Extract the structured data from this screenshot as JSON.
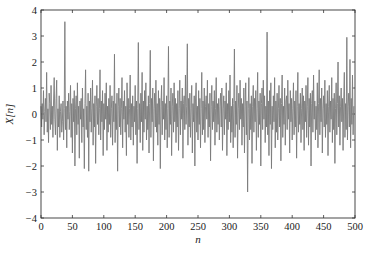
{
  "chart_data": {
    "type": "line",
    "title": "",
    "xlabel": "n",
    "ylabel": "X[n]",
    "xlim": [
      0,
      500
    ],
    "ylim": [
      -4,
      4
    ],
    "xticks": [
      0,
      50,
      100,
      150,
      200,
      250,
      300,
      350,
      400,
      450,
      500
    ],
    "yticks": [
      -4,
      -3,
      -2,
      -1,
      0,
      1,
      2,
      3,
      4
    ],
    "grid": false,
    "legend": null,
    "line_color": "#7a7a7a",
    "series": [
      {
        "name": "X[n]",
        "x_start": 0,
        "x_step": 1,
        "values": [
          0.3,
          -0.5,
          0.4,
          -0.2,
          0.9,
          -0.8,
          0.1,
          0.6,
          -0.3,
          1.6,
          -0.7,
          0.2,
          -1.1,
          0.8,
          0.4,
          -0.6,
          1.1,
          -0.4,
          0.3,
          -0.9,
          0.5,
          1.4,
          -0.2,
          -0.8,
          0.6,
          1.3,
          -1.4,
          0.2,
          -0.5,
          0.7,
          -0.9,
          0.1,
          0.4,
          -0.7,
          -0.3,
          0.5,
          -1.0,
          0.2,
          3.55,
          -0.6,
          0.3,
          -1.3,
          0.5,
          -0.2,
          0.8,
          -0.6,
          0.1,
          1.1,
          -0.9,
          0.4,
          -1.5,
          0.6,
          -0.3,
          0.9,
          -2.0,
          0.2,
          0.7,
          -0.8,
          1.2,
          -0.4,
          0.3,
          -1.7,
          0.5,
          -0.2,
          0.6,
          -1.1,
          1.0,
          -0.5,
          0.2,
          -2.1,
          0.4,
          1.7,
          -0.6,
          0.3,
          -0.9,
          0.8,
          -2.2,
          0.5,
          -0.3,
          1.0,
          -0.7,
          0.2,
          1.3,
          -1.2,
          0.4,
          -0.5,
          0.7,
          -1.9,
          0.3,
          1.1,
          -0.4,
          0.6,
          -0.8,
          0.2,
          1.7,
          -1.0,
          0.5,
          -0.3,
          0.9,
          -1.6,
          0.4,
          -0.6,
          0.8,
          -0.2,
          1.2,
          -1.4,
          0.3,
          -0.7,
          0.6,
          -0.4,
          1.1,
          -0.9,
          0.2,
          0.7,
          -1.2,
          0.5,
          -0.3,
          2.3,
          -1.1,
          0.4,
          -0.6,
          0.8,
          -2.2,
          0.3,
          1.0,
          -0.5,
          0.6,
          -0.8,
          0.2,
          1.4,
          -1.3,
          0.5,
          -0.2,
          0.9,
          -0.7,
          0.3,
          -1.6,
          1.2,
          -0.4,
          0.6,
          -0.9,
          0.2,
          1.5,
          -1.0,
          0.4,
          -0.5,
          0.7,
          -1.2,
          0.3,
          -0.3,
          1.1,
          -0.8,
          0.5,
          -1.9,
          0.2,
          2.75,
          -0.6,
          0.4,
          -1.1,
          0.8,
          -0.3,
          1.6,
          -1.4,
          0.5,
          -0.7,
          0.9,
          -0.2,
          1.2,
          -1.0,
          0.3,
          -0.6,
          0.7,
          -1.5,
          0.4,
          2.45,
          -0.9,
          0.6,
          -0.3,
          1.0,
          -1.8,
          0.2,
          0.8,
          -0.5,
          1.3,
          -0.7,
          0.4,
          -1.2,
          0.9,
          -0.4,
          0.6,
          -2.1,
          0.3,
          1.1,
          -0.8,
          0.5,
          -0.2,
          1.4,
          -1.0,
          0.4,
          -0.6,
          0.7,
          -1.3,
          0.2,
          2.6,
          -0.9,
          0.5,
          -0.4,
          1.0,
          -1.6,
          0.3,
          0.8,
          -0.7,
          1.2,
          -0.3,
          0.6,
          -1.1,
          0.4,
          -0.5,
          0.9,
          -1.4,
          0.2,
          1.3,
          -0.8,
          0.5,
          -0.2,
          1.0,
          -1.7,
          0.4,
          0.7,
          -0.6,
          1.5,
          -0.4,
          0.3,
          2.7,
          -1.2,
          0.6,
          -0.5,
          0.8,
          -0.9,
          0.2,
          1.1,
          -1.5,
          0.4,
          -0.3,
          0.7,
          -2.0,
          0.5,
          1.2,
          -0.7,
          0.3,
          -1.0,
          0.9,
          -0.4,
          0.6,
          -1.3,
          0.2,
          1.6,
          -0.8,
          0.5,
          -0.6,
          1.0,
          -1.1,
          0.3,
          0.7,
          -0.2,
          1.3,
          -0.9,
          0.4,
          -0.5,
          0.8,
          -1.8,
          0.3,
          1.1,
          -0.6,
          0.5,
          -0.3,
          0.9,
          -1.2,
          0.2,
          1.4,
          -0.7,
          0.4,
          -0.4,
          0.6,
          -1.0,
          0.3,
          0.8,
          -0.5,
          1.0,
          -1.4,
          0.2,
          0.7,
          -0.8,
          0.5,
          -0.2,
          1.2,
          -1.6,
          0.4,
          -0.6,
          0.9,
          -0.3,
          1.5,
          -1.1,
          0.3,
          -0.7,
          0.6,
          -1.3,
          0.4,
          2.5,
          -0.9,
          0.5,
          -0.4,
          1.1,
          -1.7,
          0.2,
          0.8,
          -0.6,
          1.3,
          -0.2,
          0.6,
          -1.2,
          0.4,
          -0.5,
          1.0,
          -1.5,
          0.3,
          1.2,
          -0.8,
          0.5,
          -3.0,
          0.2,
          1.4,
          -1.0,
          0.4,
          -0.6,
          0.7,
          -1.9,
          0.3,
          1.1,
          -0.7,
          0.6,
          -0.3,
          0.9,
          -1.4,
          0.2,
          1.6,
          -0.9,
          0.5,
          -0.4,
          0.8,
          -2.0,
          0.4,
          1.0,
          -0.6,
          1.3,
          -0.2,
          0.7,
          -1.1,
          0.3,
          -0.5,
          3.15,
          -0.8,
          0.5,
          -1.6,
          0.9,
          -0.4,
          1.2,
          -2.1,
          0.3,
          -0.6,
          0.7,
          -0.3,
          1.4,
          -1.3,
          0.5,
          -0.7,
          0.8,
          -1.0,
          0.2,
          1.1,
          -0.5,
          0.6,
          -1.8,
          0.4,
          1.5,
          -0.9,
          0.3,
          -0.4,
          1.0,
          -1.2,
          0.5,
          0.7,
          -0.6,
          1.3,
          -0.2,
          0.4,
          -1.5,
          0.9,
          -0.3,
          0.6,
          -1.0,
          0.2,
          1.2,
          -0.8,
          0.5,
          -0.5,
          0.9,
          -1.7,
          0.3,
          1.6,
          -0.7,
          0.4,
          -0.4,
          0.8,
          -1.1,
          0.2,
          1.0,
          -0.6,
          0.7,
          -1.4,
          0.5,
          -0.3,
          1.1,
          -0.9,
          0.3,
          1.4,
          -1.2,
          0.6,
          -0.5,
          0.8,
          -2.0,
          0.4,
          0.9,
          -0.7,
          1.5,
          -0.2,
          0.5,
          -1.0,
          0.3,
          -0.6,
          1.2,
          -1.3,
          0.4,
          1.7,
          -0.8,
          0.6,
          -0.3,
          1.0,
          -1.5,
          0.2,
          0.7,
          -0.5,
          1.3,
          -0.9,
          0.4,
          -0.4,
          0.9,
          -1.6,
          0.3,
          1.1,
          -0.7,
          0.5,
          -0.2,
          1.4,
          -1.1,
          0.6,
          -0.6,
          0.8,
          -1.9,
          0.2,
          1.2,
          -0.8,
          0.4,
          2.0,
          -0.5,
          0.7,
          -1.2,
          0.3,
          1.0,
          -0.3,
          0.6,
          -1.4,
          0.5,
          1.6,
          -0.9,
          0.4,
          -0.6,
          2.95,
          -1.0,
          0.3,
          0.8,
          -0.5,
          2.1,
          -1.3,
          0.6,
          -0.4,
          1.5,
          -0.8,
          0.3
        ]
      }
    ]
  }
}
